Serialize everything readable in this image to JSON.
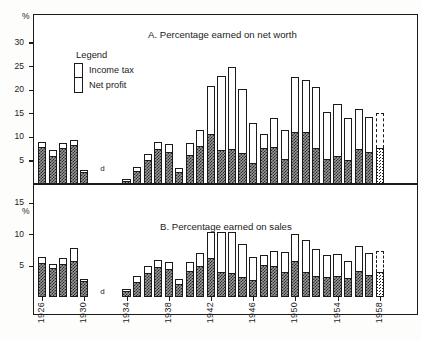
{
  "figure": {
    "percent_symbol": "%",
    "gap_marker": "d"
  },
  "legend": {
    "title": "Legend",
    "items": [
      {
        "label": "Income tax",
        "key": "income_tax",
        "fill": "white"
      },
      {
        "label": "Net profit",
        "key": "net_profit",
        "fill": "cross-hatch"
      }
    ]
  },
  "chart_data": [
    {
      "type": "bar",
      "id": "panel-a",
      "title": "A. Percentage earned on net worth",
      "stacked": true,
      "xlabel": "",
      "ylabel": "%",
      "ylim": [
        0,
        32
      ],
      "yticks": [
        5,
        10,
        15,
        20,
        25,
        30
      ],
      "grid": false,
      "legend_position": "inside-upper-left",
      "categories": [
        "1926",
        "1927",
        "1928",
        "1929",
        "1930",
        "1931",
        "1932",
        "1933",
        "1934",
        "1935",
        "1936",
        "1937",
        "1938",
        "1939",
        "1940",
        "1941",
        "1942",
        "1943",
        "1944",
        "1945",
        "1946",
        "1947",
        "1948",
        "1949",
        "1950",
        "1951",
        "1952",
        "1953",
        "1954",
        "1955",
        "1956",
        "1957",
        "1958"
      ],
      "xtick_labels": [
        "1926",
        "1930",
        "1934",
        "1938",
        "1942",
        "1946",
        "1950",
        "1954",
        "1958"
      ],
      "series": [
        {
          "name": "Net profit",
          "values": [
            7.8,
            6.0,
            7.7,
            8.2,
            2.5,
            null,
            null,
            null,
            0.7,
            2.7,
            5.1,
            7.5,
            6.8,
            2.6,
            6.1,
            8.0,
            10.6,
            7.3,
            7.4,
            6.6,
            4.4,
            7.6,
            7.8,
            5.3,
            11.0,
            11.0,
            7.6,
            5.3,
            5.9,
            5.0,
            7.5,
            6.7,
            7.6
          ]
        },
        {
          "name": "Income tax",
          "values": [
            1.2,
            1.3,
            1.0,
            1.2,
            0.5,
            null,
            null,
            null,
            0.4,
            0.8,
            1.2,
            1.5,
            1.7,
            0.8,
            2.5,
            3.5,
            10.1,
            15.5,
            17.3,
            13.5,
            8.6,
            3.1,
            6.1,
            6.2,
            11.6,
            11.0,
            13.0,
            10.0,
            11.0,
            8.9,
            8.3,
            7.4,
            7.4
          ]
        }
      ],
      "totals": [
        9.0,
        7.3,
        8.7,
        9.4,
        3.0,
        null,
        null,
        null,
        1.1,
        3.5,
        6.3,
        9.0,
        8.5,
        3.4,
        8.6,
        11.5,
        20.7,
        22.8,
        24.7,
        20.1,
        13.0,
        10.7,
        13.9,
        11.5,
        22.6,
        22.0,
        20.6,
        15.3,
        16.9,
        13.9,
        15.8,
        14.1,
        15.0
      ],
      "projected_category": "1958",
      "gap_categories": [
        "1931",
        "1932",
        "1933"
      ]
    },
    {
      "type": "bar",
      "id": "panel-b",
      "title": "B. Percentage earned on sales",
      "stacked": true,
      "xlabel": "",
      "ylabel": "%",
      "ylim": [
        0,
        17
      ],
      "yticks": [
        5,
        10,
        15
      ],
      "grid": false,
      "legend_position": "none",
      "categories": [
        "1926",
        "1927",
        "1928",
        "1929",
        "1930",
        "1931",
        "1932",
        "1933",
        "1934",
        "1935",
        "1936",
        "1937",
        "1938",
        "1939",
        "1940",
        "1941",
        "1942",
        "1943",
        "1944",
        "1945",
        "1946",
        "1947",
        "1948",
        "1949",
        "1950",
        "1951",
        "1952",
        "1953",
        "1954",
        "1955",
        "1956",
        "1957",
        "1958"
      ],
      "xtick_labels": [
        "1926",
        "1930",
        "1934",
        "1938",
        "1942",
        "1946",
        "1950",
        "1954",
        "1958"
      ],
      "series": [
        {
          "name": "Net profit",
          "values": [
            5.4,
            4.6,
            5.3,
            5.8,
            2.5,
            null,
            null,
            null,
            0.9,
            2.4,
            3.8,
            4.7,
            4.4,
            2.1,
            4.2,
            5.0,
            6.2,
            4.0,
            3.8,
            3.2,
            2.7,
            5.1,
            5.0,
            4.0,
            5.8,
            4.0,
            3.3,
            3.2,
            3.4,
            3.0,
            4.1,
            3.5,
            4.0
          ]
        },
        {
          "name": "Income tax",
          "values": [
            0.9,
            0.6,
            0.9,
            2.0,
            0.3,
            null,
            null,
            null,
            0.4,
            0.9,
            1.1,
            1.2,
            1.1,
            0.8,
            1.3,
            2.0,
            4.2,
            6.4,
            6.5,
            5.2,
            3.6,
            1.6,
            2.4,
            3.1,
            4.2,
            5.1,
            4.3,
            3.5,
            3.4,
            2.7,
            4.1,
            3.5,
            3.4
          ]
        }
      ],
      "totals": [
        6.3,
        5.2,
        6.2,
        7.8,
        2.8,
        null,
        null,
        null,
        1.3,
        3.3,
        4.9,
        5.9,
        5.5,
        2.9,
        5.5,
        7.0,
        10.4,
        10.4,
        10.3,
        8.4,
        6.3,
        6.7,
        7.4,
        7.1,
        10.0,
        9.1,
        7.6,
        6.7,
        6.8,
        5.7,
        8.2,
        7.0,
        7.4
      ],
      "projected_category": "1958",
      "gap_categories": [
        "1931",
        "1932",
        "1933"
      ]
    }
  ]
}
